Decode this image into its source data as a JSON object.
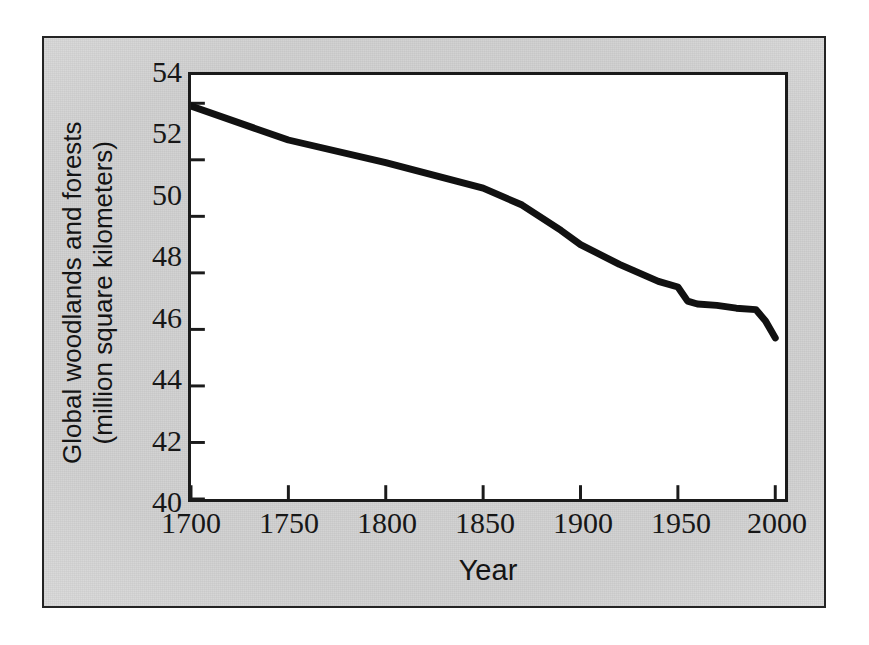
{
  "figure": {
    "background_color": "#d4d4d4",
    "frame_color": "#242424",
    "plot_background": "#ffffff",
    "axis_color": "#1b1b1b",
    "line_color": "#111111"
  },
  "axes": {
    "y_title_line1": "Global woodlands and forests",
    "y_title_line2": "(million square kilometers)",
    "x_title": "Year",
    "y_ticks": [
      "54",
      "52",
      "50",
      "48",
      "46",
      "44",
      "42",
      "40"
    ],
    "x_ticks": [
      "1700",
      "1750",
      "1800",
      "1850",
      "1900",
      "1950",
      "2000"
    ]
  },
  "chart_data": {
    "type": "line",
    "title": "",
    "xlabel": "Year",
    "ylabel": "Global woodlands and forests (million square kilometers)",
    "xlim": [
      1700,
      2005
    ],
    "ylim": [
      40,
      55
    ],
    "xticks": [
      1700,
      1750,
      1800,
      1850,
      1900,
      1950,
      2000
    ],
    "yticks": [
      40,
      42,
      44,
      46,
      48,
      50,
      52,
      54
    ],
    "grid": false,
    "legend": null,
    "series": [
      {
        "name": "Global woodlands and forests",
        "units": "million square kilometers",
        "color": "#111111",
        "x": [
          1700,
          1750,
          1800,
          1850,
          1870,
          1890,
          1900,
          1920,
          1940,
          1950,
          1955,
          1960,
          1970,
          1980,
          1990,
          1995,
          2000
        ],
        "y": [
          53.9,
          52.7,
          51.9,
          51.0,
          50.4,
          49.5,
          49.0,
          48.3,
          47.7,
          47.5,
          47.0,
          46.9,
          46.85,
          46.75,
          46.7,
          46.3,
          45.7
        ]
      }
    ]
  }
}
